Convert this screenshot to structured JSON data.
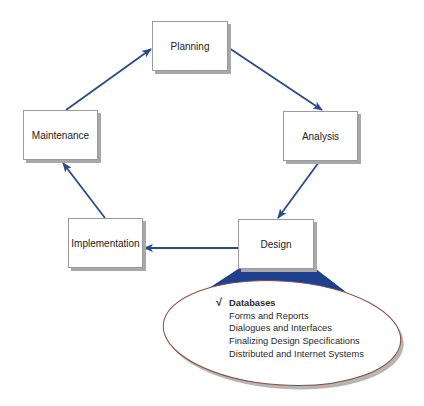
{
  "diagram": {
    "type": "cycle",
    "nodes": [
      {
        "id": "planning",
        "label": "Planning"
      },
      {
        "id": "analysis",
        "label": "Analysis"
      },
      {
        "id": "design",
        "label": "Design"
      },
      {
        "id": "implementation",
        "label": "Implementation"
      },
      {
        "id": "maintenance",
        "label": "Maintenance"
      }
    ],
    "edges": [
      {
        "from": "planning",
        "to": "analysis"
      },
      {
        "from": "analysis",
        "to": "design"
      },
      {
        "from": "design",
        "to": "implementation"
      },
      {
        "from": "implementation",
        "to": "maintenance"
      },
      {
        "from": "maintenance",
        "to": "planning"
      }
    ],
    "callout": {
      "attached_to": "design",
      "items": [
        {
          "label": "Databases",
          "checked": true,
          "check_glyph": "√"
        },
        {
          "label": "Forms and Reports",
          "checked": false
        },
        {
          "label": "Dialogues and Interfaces",
          "checked": false
        },
        {
          "label": "Finalizing Design Specifications",
          "checked": false
        },
        {
          "label": "Distributed and Internet Systems",
          "checked": false
        }
      ]
    },
    "colors": {
      "arrow": "#2a4a8c",
      "callout_fill": "#1f3f8f",
      "ellipse_outline": "#8a4a3c",
      "box_border": "#9a9a9a",
      "shadow": "#a8a8a8"
    }
  }
}
